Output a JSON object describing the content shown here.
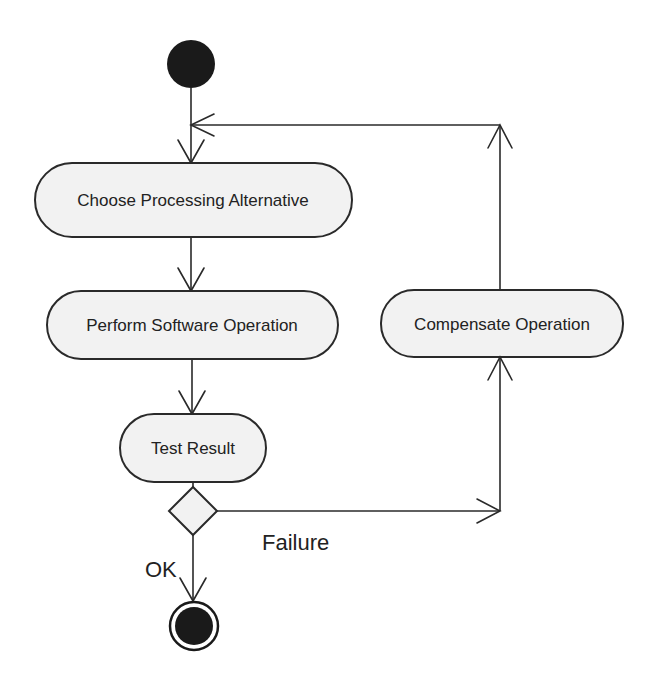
{
  "diagram": {
    "type": "UML activity diagram",
    "colors": {
      "stroke": "#2a2a2a",
      "node_fill": "#f2f2f2",
      "solid_node": "#1a1a1a",
      "background": "#ffffff"
    },
    "nodes": {
      "initial": {
        "kind": "initial-node"
      },
      "choose": {
        "kind": "action",
        "label": "Choose Processing Alternative"
      },
      "perform": {
        "kind": "action",
        "label": "Perform Software Operation"
      },
      "test": {
        "kind": "action",
        "label": "Test Result"
      },
      "decision": {
        "kind": "decision"
      },
      "compensate": {
        "kind": "action",
        "label": "Compensate Operation"
      },
      "final": {
        "kind": "final-node"
      }
    },
    "edges": [
      {
        "from": "initial",
        "to": "choose"
      },
      {
        "from": "choose",
        "to": "perform"
      },
      {
        "from": "perform",
        "to": "test"
      },
      {
        "from": "test",
        "to": "decision"
      },
      {
        "from": "decision",
        "to": "final",
        "guard": "OK"
      },
      {
        "from": "decision",
        "to": "compensate",
        "guard": "Failure"
      },
      {
        "from": "compensate",
        "to": "choose"
      }
    ],
    "guards": {
      "ok": "OK",
      "failure": "Failure"
    }
  }
}
